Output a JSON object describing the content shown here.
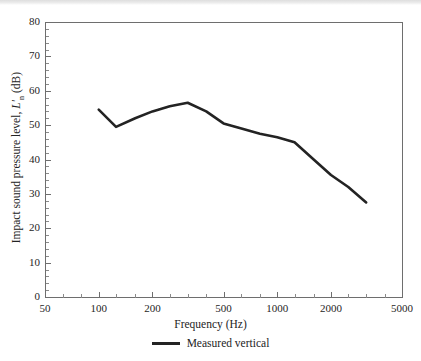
{
  "chart_data": {
    "type": "line",
    "title": "",
    "xlabel": "Frequency (Hz)",
    "ylabel": "Impact sound pressure level, L'n (dB)",
    "ylabel_parts": {
      "prefix": "Impact sound pressure level, ",
      "symbol": "L'",
      "subscript": "n",
      "units": " (dB)"
    },
    "xscale": "log",
    "xlim": [
      50,
      5000
    ],
    "ylim": [
      0,
      80
    ],
    "ytick_step": 10,
    "grid": false,
    "legend_position": "below-axes",
    "xticks": [
      {
        "value": 50,
        "label": "50"
      },
      {
        "value": 100,
        "label": "100"
      },
      {
        "value": 200,
        "label": "200"
      },
      {
        "value": 500,
        "label": "500"
      },
      {
        "value": 1000,
        "label": "1000"
      },
      {
        "value": 2000,
        "label": "2000"
      },
      {
        "value": 5000,
        "label": "5000"
      }
    ],
    "xticks_minor": [
      63,
      80,
      125,
      160,
      250,
      315,
      400,
      630,
      800,
      1250,
      1600,
      2500,
      3150,
      4000
    ],
    "yticks": [
      {
        "value": 0,
        "label": "0"
      },
      {
        "value": 10,
        "label": "10"
      },
      {
        "value": 20,
        "label": "20"
      },
      {
        "value": 30,
        "label": "30"
      },
      {
        "value": 40,
        "label": "40"
      },
      {
        "value": 50,
        "label": "50"
      },
      {
        "value": 60,
        "label": "60"
      },
      {
        "value": 70,
        "label": "70"
      },
      {
        "value": 80,
        "label": "80"
      }
    ],
    "yticks_minor_step": 2,
    "series": [
      {
        "name": "Measured vertical",
        "color": "#232323",
        "x": [
          100,
          125,
          160,
          200,
          250,
          315,
          400,
          500,
          630,
          800,
          1000,
          1250,
          1600,
          2000,
          2500,
          3150
        ],
        "values": [
          54.5,
          49.5,
          52.0,
          54.0,
          55.5,
          56.5,
          54.0,
          50.5,
          49.0,
          47.5,
          46.5,
          45.0,
          40.0,
          35.5,
          32.0,
          27.5
        ]
      }
    ]
  },
  "legend": {
    "entries": [
      {
        "label": "Measured vertical",
        "color": "#232323"
      }
    ]
  },
  "colors": {
    "series": "#232323",
    "axis": "#6e6e6e",
    "text": "#232323",
    "background": "#ffffff"
  }
}
